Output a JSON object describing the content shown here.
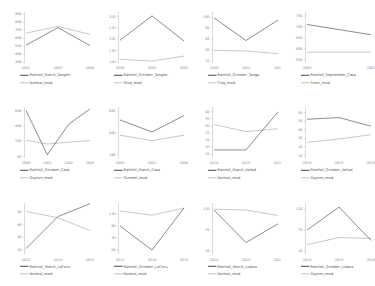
{
  "figure": {
    "layout": "3 rows x 4 columns small-multiples",
    "background": "#ffffff",
    "main_series_color": "#5a5a5a",
    "model_series_color": "#b0b0b0"
  },
  "chart_data": [
    {
      "type": "line",
      "title": "",
      "xlabel": "",
      "ylabel": "",
      "grid": false,
      "legend_position": "below",
      "categories": [
        "2001",
        "2003",
        "2004"
      ],
      "x": [
        2001,
        2003,
        2004
      ],
      "yticks": [
        300,
        400,
        500,
        600,
        700,
        800,
        900
      ],
      "ylim": [
        300,
        900
      ],
      "series": [
        {
          "name": "Rainfall_March_Tangier",
          "values": [
            510,
            730,
            505
          ]
        },
        {
          "name": "Normal_mod",
          "values": [
            660,
            745,
            645
          ]
        }
      ]
    },
    {
      "type": "line",
      "title": "",
      "xlabel": "",
      "ylabel": "",
      "grid": false,
      "legend_position": "below",
      "categories": [
        "2000",
        "2001",
        "2003"
      ],
      "x": [
        2000,
        2001,
        2003
      ],
      "yticks": [
        120,
        170,
        220,
        270,
        320
      ],
      "ylim": [
        120,
        330
      ],
      "series": [
        {
          "name": "Rainfall_October_Tangier",
          "values": [
            215,
            322,
            212
          ]
        },
        {
          "name": "Stud_mod",
          "values": [
            132,
            124,
            146
          ]
        }
      ]
    },
    {
      "type": "line",
      "title": "",
      "xlabel": "",
      "ylabel": "",
      "grid": false,
      "legend_position": "below",
      "categories": [
        "2000",
        "2001",
        "2002"
      ],
      "x": [
        2000,
        2001,
        2002
      ],
      "yticks": [
        20,
        40,
        60,
        80,
        100
      ],
      "ylim": [
        18,
        105
      ],
      "series": [
        {
          "name": "Rainfall_October_Tanga",
          "values": [
            98,
            57,
            94
          ]
        },
        {
          "name": "Clay_mod",
          "values": [
            39,
            38,
            33
          ]
        }
      ]
    },
    {
      "type": "line",
      "title": "",
      "xlabel": "",
      "ylabel": "",
      "grid": false,
      "legend_position": "below",
      "categories": [
        "2000",
        "2001"
      ],
      "x": [
        2000,
        2001
      ],
      "yticks": [
        550,
        600,
        650,
        700,
        750
      ],
      "ylim": [
        540,
        760
      ],
      "series": [
        {
          "name": "Rainfall_September_Casa",
          "values": [
            712,
            665
          ]
        },
        {
          "name": "Franc_mod",
          "values": [
            585,
            585
          ]
        }
      ]
    },
    {
      "type": "line",
      "title": "",
      "xlabel": "",
      "ylabel": "",
      "grid": false,
      "legend_position": "below",
      "categories": [
        "2000",
        "2001",
        "2002",
        "2004"
      ],
      "x": [
        2000,
        2001,
        2002,
        2004
      ],
      "yticks": [
        40,
        240,
        440,
        640
      ],
      "ylim": [
        30,
        660
      ],
      "series": [
        {
          "name": "Rainfall_October_Casa",
          "values": [
            640,
            60,
            460,
            660
          ]
        },
        {
          "name": "Gayton_mod",
          "values": [
            250,
            200,
            225,
            245
          ]
        }
      ]
    },
    {
      "type": "line",
      "title": "",
      "xlabel": "",
      "ylabel": "",
      "grid": false,
      "legend_position": "below",
      "categories": [
        "2000",
        "2002",
        "2004"
      ],
      "x": [
        2000,
        2002,
        2004
      ],
      "yticks": [
        240,
        440,
        640
      ],
      "ylim": [
        220,
        660
      ],
      "series": [
        {
          "name": "Rainfall_March_Casa",
          "values": [
            560,
            450,
            600
          ]
        },
        {
          "name": "Gumbel_mod",
          "values": [
            420,
            370,
            420
          ]
        }
      ]
    },
    {
      "type": "line",
      "title": "",
      "xlabel": "",
      "ylabel": "",
      "grid": false,
      "legend_position": "below",
      "categories": [
        "2014",
        "2015",
        "2016"
      ],
      "x": [
        2014,
        2015,
        2016
      ],
      "yticks": [
        10,
        15,
        20,
        25,
        30,
        35,
        40
      ],
      "ylim": [
        8,
        42
      ],
      "series": [
        {
          "name": "Rainfall_March_Vallad",
          "values": [
            13,
            13,
            40
          ]
        },
        {
          "name": "Normal_mod",
          "values": [
            31,
            26,
            28
          ]
        }
      ]
    },
    {
      "type": "line",
      "title": "",
      "xlabel": "",
      "ylabel": "",
      "grid": false,
      "legend_position": "below",
      "categories": [
        "2014",
        "2015",
        "2016"
      ],
      "x": [
        2014,
        2015,
        2016
      ],
      "yticks": [
        10,
        20,
        30,
        40,
        50,
        60
      ],
      "ylim": [
        8,
        64
      ],
      "series": [
        {
          "name": "Rainfall_October_Vallad",
          "values": [
            52,
            54,
            44
          ]
        },
        {
          "name": "Gayton_mod",
          "values": [
            25,
            29,
            34
          ]
        }
      ]
    },
    {
      "type": "line",
      "title": "",
      "xlabel": "",
      "ylabel": "",
      "grid": false,
      "legend_position": "below",
      "categories": [
        "2012",
        "2014",
        "2015"
      ],
      "x": [
        2012,
        2014,
        2015
      ],
      "yticks": [
        20,
        40,
        60,
        80
      ],
      "ylim": [
        15,
        90
      ],
      "series": [
        {
          "name": "Rainfall_March_LaCoru",
          "values": [
            22,
            72,
            92
          ]
        },
        {
          "name": "Normal_mod",
          "values": [
            80,
            70,
            50
          ]
        }
      ]
    },
    {
      "type": "line",
      "title": "",
      "xlabel": "",
      "ylabel": "",
      "grid": false,
      "legend_position": "below",
      "categories": [
        "2012",
        "2014",
        "2015"
      ],
      "x": [
        2012,
        2014,
        2015
      ],
      "yticks": [
        50,
        70,
        90,
        110
      ],
      "ylim": [
        45,
        125
      ],
      "series": [
        {
          "name": "Rainfall_October_LaCoru",
          "values": [
            90,
            50,
            120
          ]
        },
        {
          "name": "Normal_mod",
          "values": [
            115,
            108,
            120
          ]
        }
      ]
    },
    {
      "type": "line",
      "title": "",
      "xlabel": "",
      "ylabel": "",
      "grid": false,
      "legend_position": "below",
      "categories": [
        "2014",
        "2015",
        "2016"
      ],
      "x": [
        2014,
        2015,
        2016
      ],
      "yticks": [
        20,
        70,
        120
      ],
      "ylim": [
        15,
        130
      ],
      "series": [
        {
          "name": "Rainfall_March_Lisboa",
          "values": [
            118,
            40,
            85
          ]
        },
        {
          "name": "Normal_mod",
          "values": [
            120,
            118,
            105
          ]
        }
      ]
    },
    {
      "type": "line",
      "title": "",
      "xlabel": "",
      "ylabel": "",
      "grid": false,
      "legend_position": "below",
      "categories": [
        "2014",
        "2015",
        "2016"
      ],
      "x": [
        2014,
        2015,
        2016
      ],
      "yticks": [
        20,
        70,
        120
      ],
      "ylim": [
        15,
        130
      ],
      "series": [
        {
          "name": "Rainfall_October_Lisboa",
          "values": [
            70,
            125,
            45
          ]
        },
        {
          "name": "Gayton_mod",
          "values": [
            35,
            52,
            50
          ]
        }
      ]
    }
  ]
}
